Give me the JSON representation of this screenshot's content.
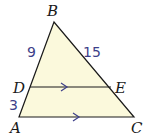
{
  "figure": {
    "type": "triangle-proportionality",
    "fill_color": "#fbf9dc",
    "stroke_color": "#1a1a1a",
    "vertices": {
      "B": {
        "label": "B"
      },
      "A": {
        "label": "A"
      },
      "C": {
        "label": "C"
      },
      "D": {
        "label": "D"
      },
      "E": {
        "label": "E"
      }
    },
    "segment_lengths": {
      "BD": "9",
      "BE": "15",
      "DA": "3"
    },
    "parallel_marks": [
      "DE",
      "AC"
    ]
  }
}
